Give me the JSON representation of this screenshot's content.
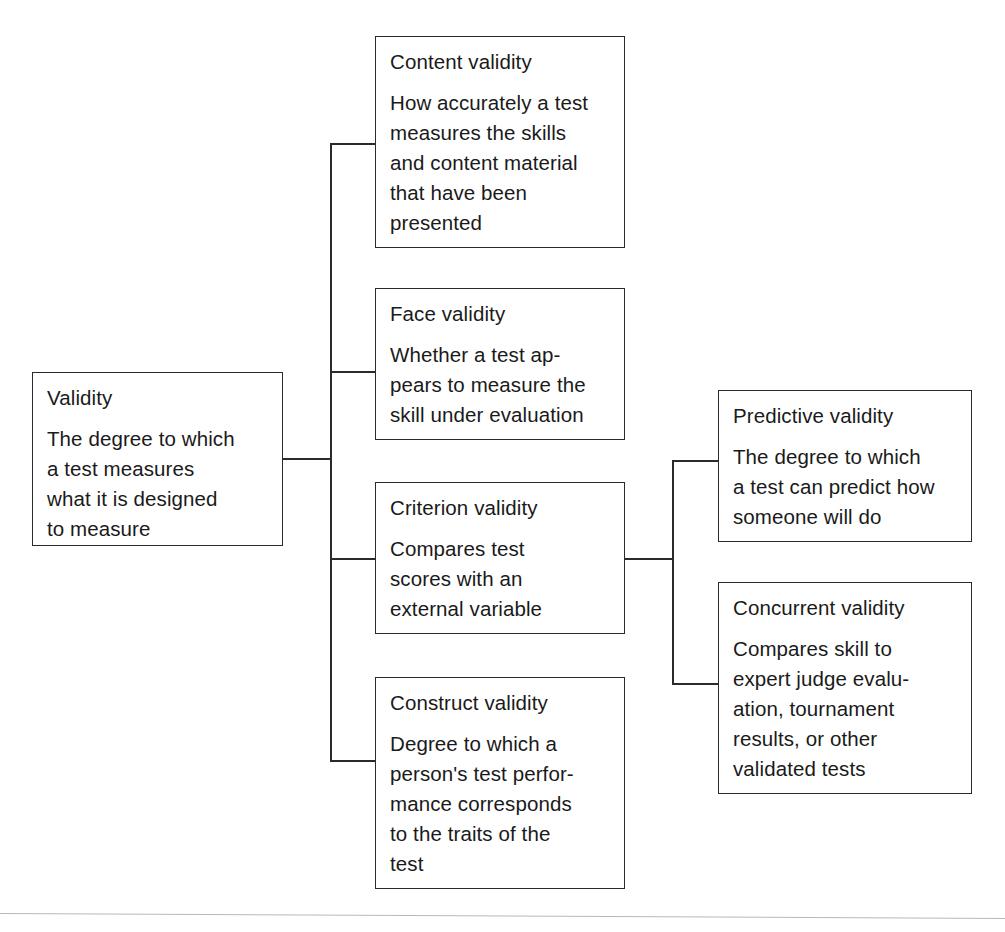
{
  "diagram": {
    "title": "Validity",
    "type": "hierarchy-tree",
    "root": {
      "id": "validity",
      "title": "Validity",
      "description_lines": [
        "The degree to which",
        "a test measures",
        "what it is designed",
        "to measure"
      ],
      "description": "The degree to which a test measures what it is designed to measure"
    },
    "branches": [
      {
        "id": "content-validity",
        "title": "Content validity",
        "description_lines": [
          "How accurately a test",
          "measures the skills",
          "and content material",
          "that have been",
          "presented"
        ],
        "description": "How accurately a test measures the skills and content material that have been presented"
      },
      {
        "id": "face-validity",
        "title": "Face validity",
        "description_lines": [
          "Whether a test ap-",
          "pears to measure the",
          "skill under evaluation"
        ],
        "description": "Whether a test appears to measure the skill under evaluation"
      },
      {
        "id": "criterion-validity",
        "title": "Criterion validity",
        "description_lines": [
          "Compares test",
          "scores with an",
          "external variable"
        ],
        "description": "Compares test scores with an external variable"
      },
      {
        "id": "construct-validity",
        "title": "Construct validity",
        "description_lines": [
          "Degree to which a",
          "person's test perfor-",
          "mance corresponds",
          "to the traits of the",
          "test"
        ],
        "description": "Degree to which a person's test performance corresponds to the traits of the test"
      }
    ],
    "sub_branches": [
      {
        "id": "predictive-validity",
        "parent": "criterion-validity",
        "title": "Predictive validity",
        "description_lines": [
          "The degree to which",
          "a test can predict how",
          "someone will do"
        ],
        "description": "The degree to which a test can predict how someone will do"
      },
      {
        "id": "concurrent-validity",
        "parent": "criterion-validity",
        "title": "Concurrent validity",
        "description_lines": [
          "Compares skill to",
          "expert judge evalu-",
          "ation, tournament",
          "results, or other",
          "validated tests"
        ],
        "description": "Compares skill to expert judge evaluation, tournament results, or other validated tests"
      }
    ],
    "colors": {
      "box_border": "#2b2b2b",
      "connector": "#2b2b2b",
      "background": "#ffffff",
      "text": "#1a1a1a",
      "page_rule": "#b9b9bd"
    }
  }
}
